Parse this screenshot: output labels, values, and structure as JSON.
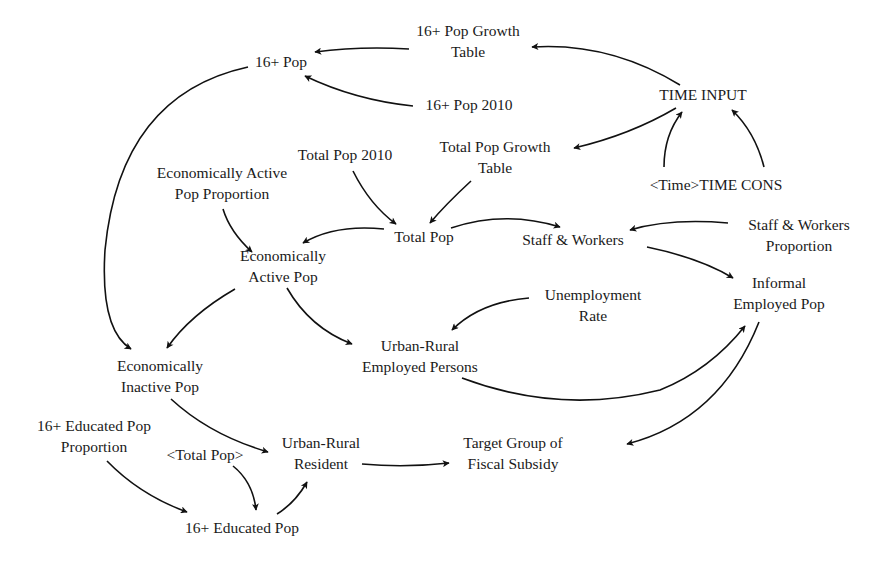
{
  "diagram": {
    "type": "causal-loop-diagram",
    "nodes": {
      "pop16_growth_table": {
        "line1": "16+ Pop Growth",
        "line2": "Table"
      },
      "pop16": {
        "line1": "16+ Pop"
      },
      "pop16_2010": {
        "line1": "16+ Pop 2010"
      },
      "time_input": {
        "line1": "TIME INPUT"
      },
      "total_pop_growth_table": {
        "line1": "Total Pop Growth",
        "line2": "Table"
      },
      "total_pop_2010": {
        "line1": "Total Pop 2010"
      },
      "econ_active_pop_proportion": {
        "line1": "Economically Active",
        "line2": "Pop Proportion"
      },
      "time_cons": {
        "line1": "<Time>TIME CONS"
      },
      "total_pop": {
        "line1": "Total Pop"
      },
      "staff_workers": {
        "line1": "Staff & Workers"
      },
      "staff_workers_proportion": {
        "line1": "Staff & Workers",
        "line2": "Proportion"
      },
      "econ_active_pop": {
        "line1": "Economically",
        "line2": "Active Pop"
      },
      "informal_employed_pop": {
        "line1": "Informal",
        "line2": "Employed Pop"
      },
      "unemployment_rate": {
        "line1": "Unemployment",
        "line2": "Rate"
      },
      "urban_rural_employed": {
        "line1": "Urban-Rural",
        "line2": "Employed Persons"
      },
      "econ_inactive_pop": {
        "line1": "Economically",
        "line2": "Inactive Pop"
      },
      "educated_pop_proportion": {
        "line1": "16+ Educated Pop",
        "line2": "Proportion"
      },
      "total_pop_shadow": {
        "line1": "<Total Pop>"
      },
      "urban_rural_resident": {
        "line1": "Urban-Rural",
        "line2": "Resident"
      },
      "target_group": {
        "line1": "Target Group of",
        "line2": "Fiscal Subsidy"
      },
      "educated_pop": {
        "line1": "16+ Educated Pop"
      }
    },
    "edges": [
      {
        "from": "TIME INPUT",
        "to": "16+ Pop Growth Table"
      },
      {
        "from": "TIME INPUT",
        "to": "Total Pop Growth Table"
      },
      {
        "from": "<Time>TIME CONS",
        "to": "TIME INPUT"
      },
      {
        "from": "<Time>TIME CONS",
        "to": "TIME INPUT"
      },
      {
        "from": "16+ Pop Growth Table",
        "to": "16+ Pop"
      },
      {
        "from": "16+ Pop 2010",
        "to": "16+ Pop"
      },
      {
        "from": "16+ Pop",
        "to": "Economically Inactive Pop"
      },
      {
        "from": "Total Pop 2010",
        "to": "Total Pop"
      },
      {
        "from": "Total Pop Growth Table",
        "to": "Total Pop"
      },
      {
        "from": "Total Pop",
        "to": "Economically Active Pop"
      },
      {
        "from": "Total Pop",
        "to": "Staff & Workers"
      },
      {
        "from": "Economically Active Pop Proportion",
        "to": "Economically Active Pop"
      },
      {
        "from": "Staff & Workers Proportion",
        "to": "Staff & Workers"
      },
      {
        "from": "Staff & Workers",
        "to": "Informal Employed Pop"
      },
      {
        "from": "Economically Active Pop",
        "to": "Economically Inactive Pop"
      },
      {
        "from": "Economically Active Pop",
        "to": "Urban-Rural Employed Persons"
      },
      {
        "from": "Unemployment Rate",
        "to": "Urban-Rural Employed Persons"
      },
      {
        "from": "Urban-Rural Employed Persons",
        "to": "Informal Employed Pop"
      },
      {
        "from": "Informal Employed Pop",
        "to": "Target Group of Fiscal Subsidy"
      },
      {
        "from": "Economically Inactive Pop",
        "to": "Urban-Rural Resident"
      },
      {
        "from": "16+ Educated Pop Proportion",
        "to": "16+ Educated Pop"
      },
      {
        "from": "<Total Pop>",
        "to": "16+ Educated Pop"
      },
      {
        "from": "16+ Educated Pop",
        "to": "Urban-Rural Resident"
      },
      {
        "from": "Urban-Rural Resident",
        "to": "Target Group of Fiscal Subsidy"
      }
    ]
  }
}
